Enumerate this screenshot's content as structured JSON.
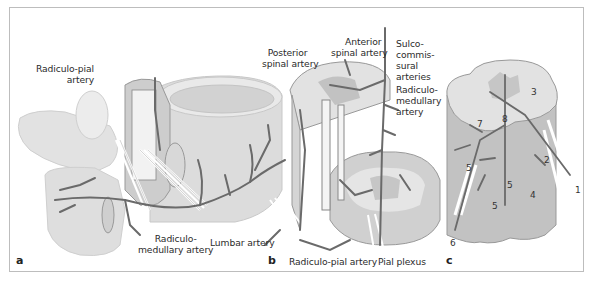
{
  "figure": {
    "panels": [
      {
        "id": "a",
        "letter": "a"
      },
      {
        "id": "b",
        "letter": "b"
      },
      {
        "id": "c",
        "letter": "c"
      }
    ],
    "labels_a": {
      "radiculo_pial": "Radiculo-pial\n      artery",
      "radiculo_medullary": "Radiculo-\nmedullary artery",
      "lumbar": "Lumbar artery"
    },
    "labels_b": {
      "posterior_spinal": "  Posterior\nspinal artery",
      "anterior_spinal": "     Anterior\nspinal artery",
      "sulco": "Sulco-\ncommis-\nsural\narteries",
      "radiculo_medullary": "Radiculo-\nmedullary\nartery",
      "radiculo_pial": "Radiculo-pial artery",
      "pial_plexus": "Pial plexus"
    },
    "numbers_c": [
      "1",
      "2",
      "3",
      "4",
      "5",
      "5",
      "5",
      "6",
      "7",
      "8"
    ],
    "colors": {
      "bone": "#e4e4e4",
      "bone_edge": "#cfcfcf",
      "cord": "#d6d6d6",
      "cord_dark": "#b9b9b9",
      "grey_matter": "#c4c4c4",
      "vessel": "#6a6a6a",
      "nerve": "#ffffff",
      "frame": "#bdbdbd"
    }
  }
}
